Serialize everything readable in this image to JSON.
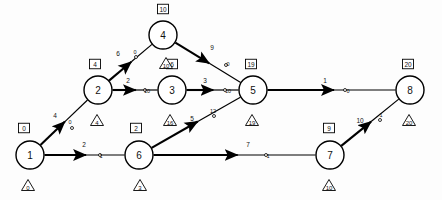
{
  "diagram": {
    "type": "network-diagram",
    "width": 442,
    "height": 200,
    "legend": {
      "box_meaning": "earliest event time",
      "triangle_meaning": "latest event time"
    },
    "nodes": [
      {
        "id": "1",
        "label": "1",
        "x": 30,
        "y": 155,
        "r": 14,
        "box": "0",
        "box_x": 24,
        "box_y": 128,
        "tri": "0",
        "tri_x": 28,
        "tri_y": 185
      },
      {
        "id": "2",
        "label": "2",
        "x": 98,
        "y": 90,
        "r": 14,
        "box": "4",
        "box_x": 95,
        "box_y": 64,
        "tri": "4",
        "tri_x": 97,
        "tri_y": 120
      },
      {
        "id": "3",
        "label": "3",
        "x": 172,
        "y": 90,
        "r": 14,
        "box": "6",
        "box_x": 172,
        "box_y": 64,
        "tri": "16",
        "tri_x": 170,
        "tri_y": 120
      },
      {
        "id": "4",
        "label": "4",
        "x": 163,
        "y": 35,
        "r": 14,
        "box": "10",
        "box_x": 163,
        "box_y": 9,
        "tri": "10",
        "tri_x": 166,
        "tri_y": 63
      },
      {
        "id": "5",
        "label": "5",
        "x": 253,
        "y": 90,
        "r": 14,
        "box": "19",
        "box_x": 251,
        "box_y": 64,
        "tri": "19",
        "tri_x": 252,
        "tri_y": 120
      },
      {
        "id": "6",
        "label": "6",
        "x": 139,
        "y": 155,
        "r": 14,
        "box": "2",
        "box_x": 136,
        "box_y": 128,
        "tri": "3",
        "tri_x": 140,
        "tri_y": 185
      },
      {
        "id": "7",
        "label": "7",
        "x": 330,
        "y": 155,
        "r": 14,
        "box": "9",
        "box_x": 329,
        "box_y": 128,
        "tri": "10",
        "tri_x": 329,
        "tri_y": 185
      },
      {
        "id": "8",
        "label": "8",
        "x": 410,
        "y": 90,
        "r": 14,
        "box": "20",
        "box_x": 408,
        "box_y": 64,
        "tri": "20",
        "tri_x": 409,
        "tri_y": 120
      }
    ],
    "edges": [
      {
        "from": "1",
        "to": "2",
        "duration": "4",
        "float": "0",
        "critical": true,
        "dur_x": 55,
        "dur_y": 118,
        "fl_x": 70,
        "fl_y": 124,
        "dot_x": 72,
        "dot_y": 128
      },
      {
        "from": "1",
        "to": "6",
        "duration": "2",
        "float": "1",
        "critical": true,
        "dur_x": 84,
        "dur_y": 147,
        "fl_x": 101,
        "fl_y": 158,
        "dot_x": 100,
        "dot_y": 155
      },
      {
        "from": "2",
        "to": "4",
        "duration": "6",
        "float": "0",
        "critical": true,
        "dur_x": 118,
        "dur_y": 56,
        "fl_x": 135,
        "fl_y": 54,
        "dot_x": 136,
        "dot_y": 57
      },
      {
        "from": "2",
        "to": "3",
        "duration": "2",
        "float": "10",
        "critical": true,
        "dur_x": 128,
        "dur_y": 83,
        "fl_x": 147,
        "fl_y": 93,
        "dot_x": 145,
        "dot_y": 90
      },
      {
        "from": "4",
        "to": "5",
        "duration": "9",
        "float": "0",
        "critical": true,
        "dur_x": 212,
        "dur_y": 50,
        "fl_x": 228,
        "fl_y": 66,
        "dot_x": 226,
        "dot_y": 65
      },
      {
        "from": "3",
        "to": "5",
        "duration": "3",
        "float": "10",
        "critical": true,
        "dur_x": 205,
        "dur_y": 83,
        "fl_x": 228,
        "fl_y": 93,
        "dot_x": 225,
        "dot_y": 90
      },
      {
        "from": "6",
        "to": "5",
        "duration": "5",
        "float": "12",
        "critical": true,
        "dur_x": 192,
        "dur_y": 121,
        "fl_x": 213,
        "fl_y": 113,
        "dot_x": 214,
        "dot_y": 116
      },
      {
        "from": "6",
        "to": "7",
        "duration": "7",
        "float": "1",
        "critical": true,
        "dur_x": 248,
        "dur_y": 147,
        "fl_x": 268,
        "fl_y": 158,
        "dot_x": 266,
        "dot_y": 155
      },
      {
        "from": "5",
        "to": "8",
        "duration": "1",
        "float": "0",
        "critical": true,
        "dur_x": 325,
        "dur_y": 83,
        "fl_x": 348,
        "fl_y": 93,
        "dot_x": 345,
        "dot_y": 90
      },
      {
        "from": "7",
        "to": "8",
        "duration": "10",
        "float": "1",
        "critical": true,
        "dur_x": 360,
        "dur_y": 123,
        "fl_x": 381,
        "fl_y": 117,
        "dot_x": 380,
        "dot_y": 120
      }
    ],
    "colors": {
      "stroke": "#000000",
      "fill": "#ffffff",
      "background": "#fdfdfd"
    }
  }
}
